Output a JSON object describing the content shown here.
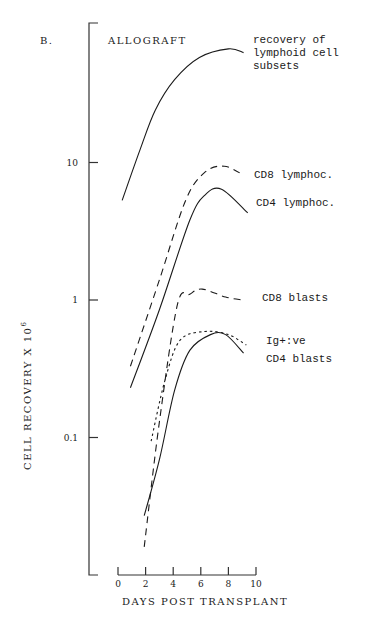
{
  "chart_data": {
    "type": "line",
    "panel_label": "B.",
    "title": "ALLOGRAFT",
    "subtitle": "recovery of lymphoid cell subsets",
    "subtitle_lines": [
      "recovery of",
      "lymphoid cell",
      "subsets"
    ],
    "xlabel": "DAYS POST TRANSPLANT",
    "ylabel": "CELL RECOVERY X 10",
    "ylabel_exponent": "6",
    "xlim": [
      0,
      10
    ],
    "ylim": [
      0.01,
      100
    ],
    "yscale": "log",
    "x_ticks": [
      0,
      2,
      4,
      6,
      8,
      10
    ],
    "x_tick_labels": [
      "0",
      "2",
      "4",
      "6",
      "8",
      "10"
    ],
    "y_ticks": [
      10,
      1,
      0.1
    ],
    "y_tick_labels": [
      "10",
      "1",
      "0.1"
    ],
    "grid": false,
    "series": [
      {
        "name": "total lymphoid cells",
        "label": "",
        "style": "solid",
        "x": [
          0.3,
          1.6,
          2.7,
          4.1,
          5.9,
          8.0,
          9.1
        ],
        "y": [
          5.3,
          12.4,
          24,
          40,
          58,
          67,
          63
        ]
      },
      {
        "name": "CD8 lymphoc.",
        "label": "CD8 lymphoc.",
        "style": "dashed",
        "x": [
          0.9,
          3.0,
          4.9,
          6.3,
          7.7,
          9.1
        ],
        "y": [
          0.33,
          1.4,
          5.3,
          8.5,
          9.4,
          8.1
        ]
      },
      {
        "name": "CD4 lymphoc.",
        "label": "CD4 lymphoc.",
        "style": "solid",
        "x": [
          0.9,
          3.0,
          5.2,
          6.3,
          7.5,
          9.4
        ],
        "y": [
          0.23,
          0.85,
          3.8,
          5.8,
          6.4,
          4.3
        ]
      },
      {
        "name": "CD8 blasts",
        "label": "CD8 blasts",
        "style": "dashed",
        "x": [
          1.9,
          3.0,
          4.3,
          5.2,
          6.1,
          7.8,
          9.0
        ],
        "y": [
          0.016,
          0.13,
          0.92,
          1.1,
          1.2,
          1.05,
          1.0
        ]
      },
      {
        "name": "Ig+:ve",
        "label": "Ig+:ve",
        "style": "dotted",
        "x": [
          2.4,
          3.4,
          4.5,
          6.3,
          8.0,
          9.3
        ],
        "y": [
          0.094,
          0.26,
          0.51,
          0.59,
          0.56,
          0.47
        ]
      },
      {
        "name": "CD4 blasts",
        "label": "CD4 blasts",
        "style": "solid",
        "x": [
          1.9,
          3.0,
          4.1,
          5.2,
          6.7,
          7.8,
          9.1
        ],
        "y": [
          0.027,
          0.069,
          0.22,
          0.43,
          0.56,
          0.56,
          0.41
        ]
      }
    ]
  }
}
